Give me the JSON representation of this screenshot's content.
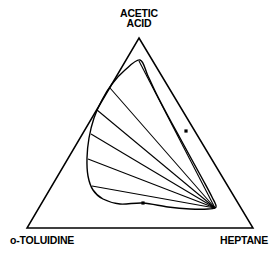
{
  "figure": {
    "kind": "ternary-phase-diagram",
    "background_color": "#ffffff",
    "line_color": "#000000",
    "title": ""
  },
  "labels": {
    "apex_line1": "ACETIC",
    "apex_line2": "ACID",
    "bottom_left": "o-TOLUIDINE",
    "bottom_right": "HEPTANE"
  },
  "chart_data": {
    "type": "scatter",
    "title": "",
    "xlabel": "",
    "ylabel": "",
    "components": [
      "ACETIC ACID",
      "o-TOLUIDINE",
      "HEPTANE"
    ],
    "diagram_kind": "ternary liquid-liquid equilibrium",
    "triangle_vertices": {
      "acetic_acid_apex": [
        139,
        38
      ],
      "o_toluidine_corner": [
        27,
        228
      ],
      "heptane_corner": [
        253,
        228
      ]
    },
    "binodal_curve": {
      "name": "binodal (solubility) curve",
      "closed": true,
      "points": [
        [
          140,
          60
        ],
        [
          125,
          70
        ],
        [
          112,
          84
        ],
        [
          102,
          100
        ],
        [
          94,
          118
        ],
        [
          89,
          138
        ],
        [
          87,
          158
        ],
        [
          88,
          176
        ],
        [
          93,
          190
        ],
        [
          103,
          199
        ],
        [
          120,
          204
        ],
        [
          143,
          203
        ],
        [
          168,
          207
        ],
        [
          190,
          209
        ],
        [
          208,
          209
        ],
        [
          216,
          207
        ],
        [
          212,
          197
        ],
        [
          203,
          180
        ],
        [
          192,
          160
        ],
        [
          180,
          138
        ],
        [
          168,
          116
        ],
        [
          157,
          95
        ],
        [
          148,
          76
        ],
        [
          140,
          60
        ]
      ]
    },
    "tie_lines": {
      "count": 6,
      "description": "tie lines fan from the left branch of the binodal and converge near the lower-right tip",
      "convergence_point": [
        215,
        208
      ],
      "lines": [
        {
          "left_end": [
            139,
            61
          ],
          "right_end": [
            215,
            208
          ]
        },
        {
          "left_end": [
            110,
            88
          ],
          "right_end": [
            215,
            208
          ]
        },
        {
          "left_end": [
            97,
            110
          ],
          "right_end": [
            215,
            208
          ]
        },
        {
          "left_end": [
            91,
            134
          ],
          "right_end": [
            215,
            208
          ]
        },
        {
          "left_end": [
            88,
            159
          ],
          "right_end": [
            215,
            208
          ]
        },
        {
          "left_end": [
            92,
            186
          ],
          "right_end": [
            215,
            208
          ]
        }
      ]
    },
    "data_points": {
      "marker": "filled-square",
      "count": 2,
      "points": [
        [
          186,
          131
        ],
        [
          143,
          203
        ]
      ]
    },
    "grid": false,
    "legend": "none"
  }
}
